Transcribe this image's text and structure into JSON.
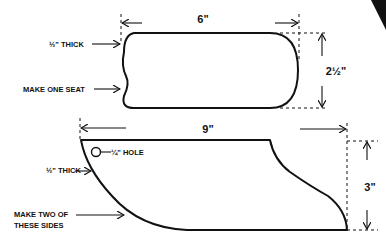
{
  "seat": {
    "width_label": "6\"",
    "height_label": "2½\"",
    "thickness_label": "½\" THICK",
    "quantity_label": "MAKE ONE SEAT"
  },
  "side": {
    "width_label": "9\"",
    "height_label": "3\"",
    "hole_label": "¼\" HOLE",
    "thickness_label": "½\" THICK",
    "quantity_label_line1": "MAKE TWO OF",
    "quantity_label_line2": "THESE SIDES"
  },
  "colors": {
    "ink": "#111111",
    "paper": "#ffffff"
  }
}
